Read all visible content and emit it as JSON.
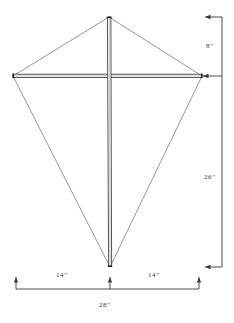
{
  "figure": {
    "units": "inches",
    "ink_color": "#2b2b2b",
    "outline_color": "#555555",
    "background_color": "#ffffff"
  },
  "kite": {
    "apex_top": {
      "x": 109,
      "y": 17
    },
    "tip_left": {
      "x": 13,
      "y": 76
    },
    "tip_right": {
      "x": 202,
      "y": 76
    },
    "tip_bottom": {
      "x": 110,
      "y": 267
    },
    "spine_label": "vertical-spar",
    "crossbar_label": "horizontal-spar"
  },
  "dimensions": {
    "vertical": {
      "axis_x": 222,
      "ticks": [
        17,
        76,
        267
      ],
      "segments": [
        {
          "name": "top-section",
          "label": "8\"",
          "value": 8,
          "from_y": 17,
          "to_y": 76
        },
        {
          "name": "bottom-section",
          "label": "26\"",
          "value": 26,
          "from_y": 76,
          "to_y": 267
        }
      ]
    },
    "horizontal": {
      "axis_y": 289,
      "ticks": [
        16,
        110,
        199
      ],
      "segments": [
        {
          "name": "left-half",
          "label": "14\"",
          "value": 14,
          "from_x": 16,
          "to_x": 110
        },
        {
          "name": "right-half",
          "label": "14\"",
          "value": 14,
          "from_x": 110,
          "to_x": 199
        }
      ],
      "total": {
        "name": "total-width",
        "label": "28\"",
        "value": 28
      }
    }
  }
}
